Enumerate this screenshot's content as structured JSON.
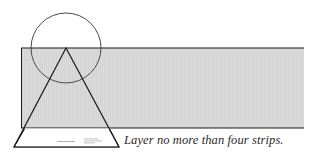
{
  "diagram": {
    "caption": "Layer no more than four strips.",
    "colors": {
      "strip_fill": "#d9d9d9",
      "strip_stroke": "#1a1a1a",
      "circle_stroke": "#4a4a4a",
      "triangle_stroke": "#1a1a1a",
      "caption_color": "#2a2a2a",
      "label_text": "#9a9a9a"
    },
    "shapes": {
      "strip": {
        "x": 21,
        "y": 48,
        "width": 283,
        "height": 80
      },
      "circle": {
        "cx": 66,
        "cy": 48,
        "r": 35
      },
      "triangle": {
        "apex": [
          66,
          48
        ],
        "base_left": [
          14,
          147
        ],
        "base_right": [
          119,
          147
        ]
      }
    },
    "triangle_label": {
      "line1": "",
      "line2": ""
    }
  }
}
